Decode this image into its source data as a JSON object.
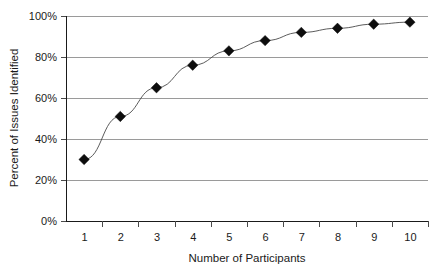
{
  "chart_data": {
    "type": "line",
    "title": "",
    "subtitle": "",
    "xlabel": "Number of Participants",
    "ylabel": "Percent of Issues Identified",
    "categories": [
      1,
      2,
      3,
      4,
      5,
      6,
      7,
      8,
      9,
      10
    ],
    "x_tick_labels": [
      "1",
      "2",
      "3",
      "4",
      "5",
      "6",
      "7",
      "8",
      "9",
      "10"
    ],
    "y_tick_labels": [
      "0%",
      "20%",
      "40%",
      "60%",
      "80%",
      "100%"
    ],
    "y_tick_values": [
      0,
      20,
      40,
      60,
      80,
      100
    ],
    "values": [
      30,
      51,
      65,
      76,
      83,
      88,
      92,
      94,
      96,
      97
    ],
    "series": [
      {
        "name": "Percent of Issues Identified",
        "values": [
          30,
          51,
          65,
          76,
          83,
          88,
          92,
          94,
          96,
          97
        ]
      }
    ],
    "point_labels": [
      "30%",
      "51%",
      "65%",
      "76%",
      "83%",
      "88%",
      "92%",
      "94%",
      "96%",
      "97%"
    ],
    "ylim": [
      0,
      100
    ],
    "xlim": [
      0.5,
      10.5
    ],
    "grid": "horizontal",
    "legend": "none",
    "marker": "diamond",
    "marker_color": "#0d0d0d",
    "line_color": "#4a4a4a",
    "gridline_color": "#9a9a9a",
    "axis_color": "#1a1a1a",
    "background_color": "#ffffff"
  }
}
